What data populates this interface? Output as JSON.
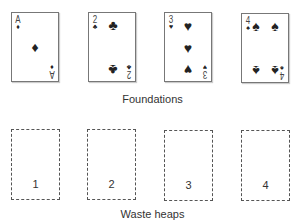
{
  "foundations": {
    "label": "Foundations",
    "cards": [
      {
        "rank": "A",
        "suit": "♦",
        "suit_name": "diamonds"
      },
      {
        "rank": "2",
        "suit": "♣",
        "suit_name": "clubs"
      },
      {
        "rank": "3",
        "suit": "♥",
        "suit_name": "hearts"
      },
      {
        "rank": "4",
        "suit": "♠",
        "suit_name": "spades"
      }
    ]
  },
  "waste_heaps": {
    "label": "Waste heaps",
    "heaps": [
      {
        "number": "1"
      },
      {
        "number": "2"
      },
      {
        "number": "3"
      },
      {
        "number": "4"
      }
    ]
  }
}
